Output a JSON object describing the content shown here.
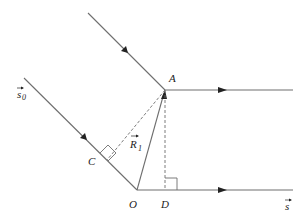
{
  "diagram": {
    "points": {
      "A": {
        "label": "A",
        "x": 165,
        "y": 90
      },
      "O": {
        "label": "O",
        "x": 137,
        "y": 190
      },
      "C": {
        "label": "C",
        "x": 107,
        "y": 160
      },
      "D": {
        "label": "D",
        "x": 165,
        "y": 190
      }
    },
    "labels": {
      "A": "A",
      "O": "O",
      "C": "C",
      "D": "D",
      "R1_main": "R",
      "R1_sub": "1",
      "s0_main": "s",
      "s0_sub": "0",
      "s_main": "s",
      "vector_arrow": "→"
    },
    "edges": [
      {
        "from": "incident-upper-start",
        "to": "A",
        "style": "solid",
        "arrow": "mid"
      },
      {
        "from": "A",
        "to": "scattered-upper-end",
        "style": "solid",
        "arrow": "mid"
      },
      {
        "from": "incident-lower-start",
        "to": "O",
        "style": "solid",
        "arrow": "mid"
      },
      {
        "from": "O",
        "to": "scattered-lower-end",
        "style": "solid",
        "arrow": "mid"
      },
      {
        "from": "O",
        "to": "A",
        "style": "solid",
        "arrow": "end",
        "label": "R1"
      },
      {
        "from": "A",
        "to": "C",
        "style": "dashed",
        "right_angle_at": "C"
      },
      {
        "from": "A",
        "to": "D",
        "style": "dashed",
        "right_angle_at": "D"
      }
    ],
    "colors": {
      "line": "#6e6e6e",
      "text": "#222222",
      "background": "#ffffff"
    }
  }
}
